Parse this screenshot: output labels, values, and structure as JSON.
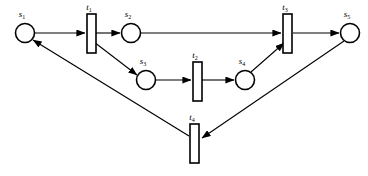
{
  "diagram": {
    "kind": "petri-net",
    "background_color": "#ffffff",
    "stroke_color": "#000000",
    "width": 368,
    "height": 176,
    "places": [
      {
        "id": "s1",
        "label_base": "s",
        "label_sub": "1",
        "label": "s1",
        "cx": 25,
        "cy": 33,
        "r": 9.5,
        "label_x": 22,
        "label_y": 17
      },
      {
        "id": "s2",
        "label_base": "s",
        "label_sub": "2",
        "label": "s2",
        "cx": 131,
        "cy": 33,
        "r": 9.5,
        "label_x": 128,
        "label_y": 17
      },
      {
        "id": "s3",
        "label_base": "s",
        "label_sub": "3",
        "label": "s3",
        "cx": 146,
        "cy": 80,
        "r": 9.5,
        "label_x": 143,
        "label_y": 64
      },
      {
        "id": "s4",
        "label_base": "s",
        "label_sub": "4",
        "label": "s4",
        "cx": 245,
        "cy": 80,
        "r": 9.5,
        "label_x": 242,
        "label_y": 64
      },
      {
        "id": "s5",
        "label_base": "s",
        "label_sub": "5",
        "label": "s5",
        "cx": 350,
        "cy": 33,
        "r": 9.5,
        "label_x": 347,
        "label_y": 17
      }
    ],
    "transitions": [
      {
        "id": "t1",
        "label_base": "t",
        "label_sub": "1",
        "label": "t1",
        "x": 87,
        "y": 14,
        "w": 9,
        "h": 39,
        "label_x": 89,
        "label_y": 10
      },
      {
        "id": "t2",
        "label_base": "t",
        "label_sub": "2",
        "label": "t2",
        "x": 193,
        "y": 62,
        "w": 9,
        "h": 39,
        "label_x": 195,
        "label_y": 58
      },
      {
        "id": "t3",
        "label_base": "t",
        "label_sub": "3",
        "label": "t3",
        "x": 283,
        "y": 14,
        "w": 9,
        "h": 39,
        "label_x": 285,
        "label_y": 10
      },
      {
        "id": "t4",
        "label_base": "t",
        "label_sub": "4",
        "label": "t4",
        "x": 190,
        "y": 124,
        "w": 9,
        "h": 39,
        "label_x": 192,
        "label_y": 120
      }
    ],
    "arcs": [
      {
        "id": "arc-s1-t1",
        "from": "s1",
        "to": "t1",
        "d": "M 35 33 L 85 33"
      },
      {
        "id": "arc-t1-s2",
        "from": "t1",
        "to": "s2",
        "d": "M 96 33 L 120 33"
      },
      {
        "id": "arc-t1-s3",
        "from": "t1",
        "to": "s3",
        "d": "M 94 42 L 137 75"
      },
      {
        "id": "arc-s2-t3",
        "from": "s2",
        "to": "t3",
        "d": "M 141 33 L 281 33"
      },
      {
        "id": "arc-s3-t2",
        "from": "s3",
        "to": "t2",
        "d": "M 156 80 L 191 80"
      },
      {
        "id": "arc-t2-s4",
        "from": "t2",
        "to": "s4",
        "d": "M 202 80 L 234 80"
      },
      {
        "id": "arc-s4-t3",
        "from": "s4",
        "to": "t3",
        "d": "M 251 72 L 284 43"
      },
      {
        "id": "arc-t3-s5",
        "from": "t3",
        "to": "s5",
        "d": "M 293 33 L 339 33"
      },
      {
        "id": "arc-s5-t4",
        "from": "s5",
        "to": "t4",
        "d": "M 344 41 L 202 138"
      },
      {
        "id": "arc-t4-s1",
        "from": "t4",
        "to": "s1",
        "d": "M 189 136 L 33 40"
      }
    ]
  }
}
